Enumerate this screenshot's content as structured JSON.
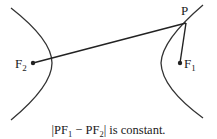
{
  "diagram": {
    "type": "hyperbola-definition",
    "colors": {
      "stroke": "#333333",
      "text": "#1a1a1a",
      "background": "#ffffff"
    },
    "labels": {
      "P": "P",
      "F1_base": "F",
      "F1_sub": "1",
      "F2_base": "F",
      "F2_sub": "2"
    },
    "caption": {
      "open": "|PF",
      "sub1": "1",
      "minus": " − PF",
      "sub2": "2",
      "close": "| is constant."
    }
  }
}
